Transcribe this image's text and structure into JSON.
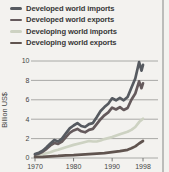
{
  "legend": {
    "items": [
      {
        "label": "Developed world imports",
        "color": "#565a60"
      },
      {
        "label": "Developed world exports",
        "color": "#655a5c"
      },
      {
        "label": "Developing world imports",
        "color": "#cdd2c2"
      },
      {
        "label": "Developing world exports",
        "color": "#60544f"
      }
    ]
  },
  "chart_data": {
    "type": "line",
    "title": "",
    "xlabel": "",
    "ylabel": "Billion US$",
    "xlim": [
      1970,
      1998
    ],
    "ylim": [
      0,
      10
    ],
    "xticks": [
      1970,
      1980,
      1990,
      1998
    ],
    "yticks": [
      0,
      2,
      4,
      6,
      8,
      10
    ],
    "grid": "horizontal",
    "legend_position": "top-left",
    "series": [
      {
        "name": "Developed world imports",
        "color": "#565a60",
        "points": [
          [
            1970,
            0.4
          ],
          [
            1971,
            0.55
          ],
          [
            1972,
            0.75
          ],
          [
            1973,
            1.1
          ],
          [
            1974,
            1.5
          ],
          [
            1975,
            1.85
          ],
          [
            1976,
            1.7
          ],
          [
            1977,
            2.0
          ],
          [
            1978,
            2.55
          ],
          [
            1979,
            3.05
          ],
          [
            1980,
            3.35
          ],
          [
            1981,
            3.6
          ],
          [
            1982,
            3.3
          ],
          [
            1983,
            3.2
          ],
          [
            1984,
            3.5
          ],
          [
            1985,
            3.6
          ],
          [
            1986,
            4.2
          ],
          [
            1987,
            4.85
          ],
          [
            1988,
            5.25
          ],
          [
            1989,
            5.6
          ],
          [
            1990,
            6.15
          ],
          [
            1991,
            5.95
          ],
          [
            1992,
            6.2
          ],
          [
            1993,
            5.95
          ],
          [
            1994,
            6.3
          ],
          [
            1995,
            7.25
          ],
          [
            1996,
            8.2
          ],
          [
            1997,
            9.9
          ],
          [
            1997.6,
            9.0
          ],
          [
            1998,
            9.6
          ]
        ]
      },
      {
        "name": "Developed world exports",
        "color": "#655a5c",
        "points": [
          [
            1970,
            0.35
          ],
          [
            1971,
            0.45
          ],
          [
            1972,
            0.65
          ],
          [
            1973,
            0.95
          ],
          [
            1974,
            1.3
          ],
          [
            1975,
            1.55
          ],
          [
            1976,
            1.45
          ],
          [
            1977,
            1.7
          ],
          [
            1978,
            2.15
          ],
          [
            1979,
            2.6
          ],
          [
            1980,
            2.85
          ],
          [
            1981,
            3.0
          ],
          [
            1982,
            2.75
          ],
          [
            1983,
            2.65
          ],
          [
            1984,
            2.9
          ],
          [
            1985,
            3.0
          ],
          [
            1986,
            3.5
          ],
          [
            1987,
            4.0
          ],
          [
            1988,
            4.4
          ],
          [
            1989,
            4.7
          ],
          [
            1990,
            5.2
          ],
          [
            1991,
            5.0
          ],
          [
            1992,
            5.25
          ],
          [
            1993,
            4.95
          ],
          [
            1994,
            5.15
          ],
          [
            1995,
            6.0
          ],
          [
            1996,
            6.65
          ],
          [
            1997,
            7.9
          ],
          [
            1997.6,
            7.2
          ],
          [
            1998,
            7.7
          ]
        ]
      },
      {
        "name": "Developing world imports",
        "color": "#cdd2c2",
        "points": [
          [
            1970,
            0.2
          ],
          [
            1972,
            0.4
          ],
          [
            1974,
            0.6
          ],
          [
            1975,
            0.75
          ],
          [
            1976,
            0.85
          ],
          [
            1978,
            1.1
          ],
          [
            1980,
            1.35
          ],
          [
            1982,
            1.55
          ],
          [
            1984,
            1.75
          ],
          [
            1985,
            1.7
          ],
          [
            1986,
            1.7
          ],
          [
            1987,
            1.8
          ],
          [
            1988,
            1.95
          ],
          [
            1990,
            2.15
          ],
          [
            1992,
            2.45
          ],
          [
            1994,
            2.7
          ],
          [
            1995,
            2.9
          ],
          [
            1996,
            3.2
          ],
          [
            1997,
            3.7
          ],
          [
            1998,
            4.05
          ]
        ]
      },
      {
        "name": "Developing world exports",
        "color": "#60544f",
        "points": [
          [
            1970,
            0.1
          ],
          [
            1972,
            0.12
          ],
          [
            1974,
            0.18
          ],
          [
            1976,
            0.22
          ],
          [
            1978,
            0.28
          ],
          [
            1980,
            0.3
          ],
          [
            1982,
            0.35
          ],
          [
            1984,
            0.4
          ],
          [
            1986,
            0.45
          ],
          [
            1988,
            0.5
          ],
          [
            1990,
            0.6
          ],
          [
            1992,
            0.7
          ],
          [
            1994,
            0.85
          ],
          [
            1995,
            1.0
          ],
          [
            1996,
            1.2
          ],
          [
            1997,
            1.5
          ],
          [
            1998,
            1.75
          ]
        ]
      }
    ]
  },
  "colors": {
    "background": "#f3f2ef",
    "grid": "#a0a09e",
    "axis_text": "#454545",
    "legend_text": "#373737",
    "border": "#bcbcba"
  }
}
